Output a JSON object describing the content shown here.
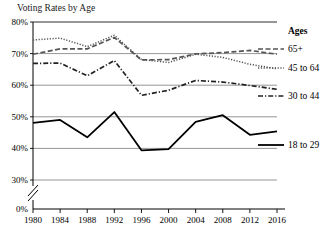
{
  "chart_data": {
    "type": "line",
    "title": "Voting Rates by Age",
    "xlabel": "",
    "ylabel": "",
    "x": [
      1980,
      1984,
      1988,
      1992,
      1996,
      2000,
      2004,
      2008,
      2012,
      2016
    ],
    "xtick_labels": [
      "1980",
      "1984",
      "1988",
      "1992",
      "1996",
      "2000",
      "2004",
      "2008",
      "2012",
      "2016"
    ],
    "ytick_labels": [
      "0%",
      "30%",
      "40%",
      "50%",
      "60%",
      "70%",
      "80%"
    ],
    "ytick_values": [
      0,
      30,
      40,
      50,
      60,
      70,
      80
    ],
    "ylim": [
      30,
      80
    ],
    "y_axis_break": true,
    "grid": "horizontal",
    "legend_position": "right",
    "legend_title": "Ages",
    "series": [
      {
        "name": "65+",
        "style": "dashed",
        "color": "#555555",
        "values": [
          69.8,
          71.5,
          71.5,
          75.1,
          68.0,
          68.1,
          69.9,
          70.3,
          71.0,
          69.8
        ]
      },
      {
        "name": "45 to 64",
        "style": "dotted",
        "color": "#555555",
        "values": [
          74.3,
          74.9,
          72.2,
          75.8,
          68.1,
          67.2,
          69.8,
          68.8,
          66.6,
          65.2
        ]
      },
      {
        "name": "30 to 44",
        "style": "dash-dot",
        "color": "#222222",
        "values": [
          66.9,
          67.0,
          63.0,
          67.8,
          56.8,
          58.4,
          61.5,
          61.0,
          59.9,
          58.7
        ]
      },
      {
        "name": "18 to 29",
        "style": "solid",
        "color": "#000000",
        "values": [
          48.1,
          49.0,
          43.5,
          51.5,
          39.4,
          39.8,
          48.4,
          50.5,
          44.3,
          45.4
        ]
      }
    ]
  },
  "legend": {
    "heading": "Ages",
    "items": [
      {
        "label": "65+"
      },
      {
        "label": "45 to 64"
      },
      {
        "label": "30 to 44"
      },
      {
        "label": "18 to 29"
      }
    ]
  }
}
